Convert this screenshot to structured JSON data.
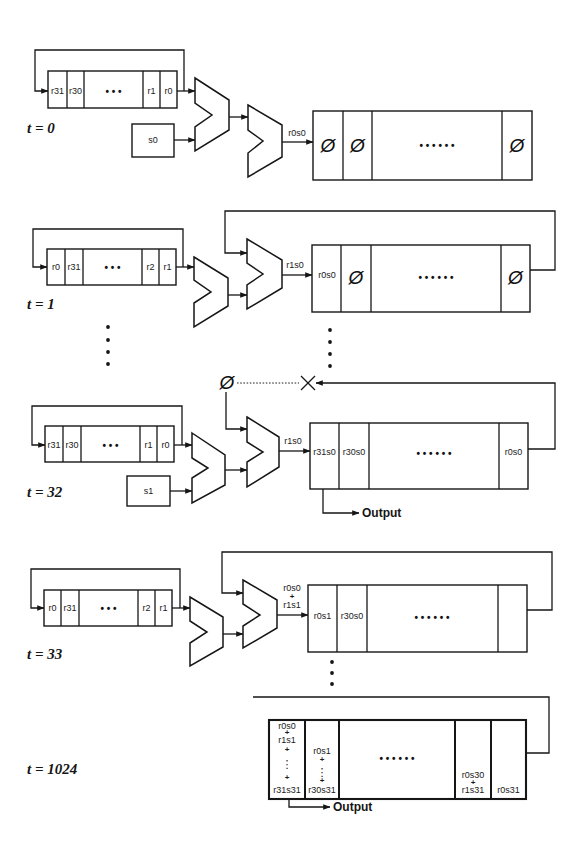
{
  "figure": {
    "null_symbol": "Ø",
    "steps": [
      {
        "time_label": "t = 0",
        "register_cells": [
          "r31",
          "r30",
          "• • •",
          "r1",
          "r0"
        ],
        "s_input": "s0",
        "adder_output_label": [
          "r0s0"
        ],
        "accumulator_cells": [
          "Ø",
          "Ø",
          "• • • • • •",
          "Ø"
        ]
      },
      {
        "time_label": "t = 1",
        "register_cells": [
          "r0",
          "r31",
          "• • •",
          "r2",
          "r1"
        ],
        "adder_output_label": [
          "r1s0"
        ],
        "accumulator_cells": [
          "r0s0",
          "Ø",
          "• • • • • •",
          "Ø"
        ]
      },
      {
        "time_label": "t = 32",
        "register_cells": [
          "r31",
          "r30",
          "• • •",
          "r1",
          "r0"
        ],
        "s_input": "s1",
        "feedback_source": "Ø",
        "adder_output_label": [
          "r1s0"
        ],
        "accumulator_cells": [
          "r31s0",
          "r30s0",
          "• • • • • •",
          "r0s0"
        ],
        "output_label": "Output"
      },
      {
        "time_label": "t = 33",
        "register_cells": [
          "r0",
          "r31",
          "• • •",
          "r2",
          "r1"
        ],
        "adder_output_label": [
          "r0s0",
          "+",
          "r1s1"
        ],
        "accumulator_cells": [
          "r0s1",
          "r30s0",
          "• • • • • •",
          ""
        ]
      },
      {
        "time_label": "t = 1024",
        "accumulator_cells": [
          [
            "r0s0",
            "+",
            "r1s1",
            "+",
            "⋮",
            "+",
            "r31s31"
          ],
          [
            "r0s1",
            "+",
            "⋮",
            "+",
            "r30s31"
          ],
          [
            "• • • • • •"
          ],
          [
            "r0s30",
            "+",
            "r1s31"
          ],
          [
            "r0s31"
          ]
        ],
        "output_label": "Output"
      }
    ]
  }
}
